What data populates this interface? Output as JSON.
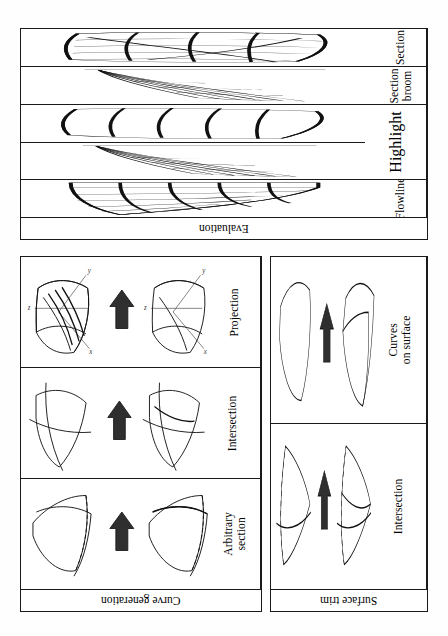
{
  "figure": {
    "orientation": "rotated-90",
    "colors": {
      "ink": "#111111",
      "rule": "#1a1a1a",
      "arrow": "#2f2f2f",
      "paper": "#fefefe"
    }
  },
  "groups": [
    {
      "id": "evaluation",
      "caption": "Evaluation",
      "rows": [
        {
          "label": "Section",
          "art": "section-grid-surface"
        },
        {
          "label": "Section\nbroom",
          "art": "section-broom"
        },
        {
          "label": "Highlight",
          "art": "highlight-strips",
          "art2": "highlight-broom",
          "merged": true
        },
        {
          "label": "Flowline",
          "art": "flowline-grid"
        }
      ]
    },
    {
      "id": "curve-generation",
      "caption": "Curve generation",
      "rows": [
        {
          "label": "Projection",
          "before": "projection-before",
          "after": "projection-after"
        },
        {
          "label": "Intersection",
          "before": "intersection-before",
          "after": "intersection-after"
        },
        {
          "label": "Arbitrary\nsection",
          "before": "arbitrary-before",
          "after": "arbitrary-after"
        }
      ]
    },
    {
      "id": "surface-trim",
      "caption": "Surface trim",
      "rows": [
        {
          "label": "Curves\non surface",
          "before": "curves-on-surface-before",
          "after": "curves-on-surface-after"
        },
        {
          "label": "Intersection",
          "before": "trim-intersection-before",
          "after": "trim-intersection-after"
        }
      ]
    }
  ],
  "axis_labels": {
    "x": "x",
    "y": "y",
    "z": "z"
  },
  "arrow": {
    "name": "transform-arrow",
    "glyph": "up-arrow"
  }
}
